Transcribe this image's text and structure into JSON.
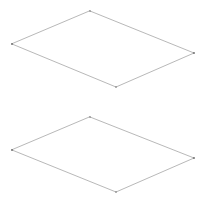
{
  "canvas": {
    "width": 206,
    "height": 201,
    "background_color": "#ffffff",
    "title": "Wireframe Planes"
  },
  "style": {
    "stroke_color": "#9a9a9a",
    "vertex_color": "#6b6b6b",
    "fill_color": "#ffffff",
    "stroke_width": 0.7,
    "corner_style": "round"
  },
  "shapes": [
    {
      "name": "upper-plane",
      "type": "quadrilateral",
      "points": "90,11 194,53 116,87 12,44",
      "vertices": [
        {
          "label": "top",
          "x": 90,
          "y": 11
        },
        {
          "label": "right",
          "x": 194,
          "y": 53
        },
        {
          "label": "bottom",
          "x": 116,
          "y": 87
        },
        {
          "label": "left",
          "x": 12,
          "y": 44
        }
      ]
    },
    {
      "name": "lower-plane",
      "type": "quadrilateral",
      "points": "90,117 194,158 116,192 12,150",
      "vertices": [
        {
          "label": "top",
          "x": 90,
          "y": 117
        },
        {
          "label": "right",
          "x": 194,
          "y": 158
        },
        {
          "label": "bottom",
          "x": 116,
          "y": 192
        },
        {
          "label": "left",
          "x": 12,
          "y": 150
        }
      ]
    }
  ]
}
